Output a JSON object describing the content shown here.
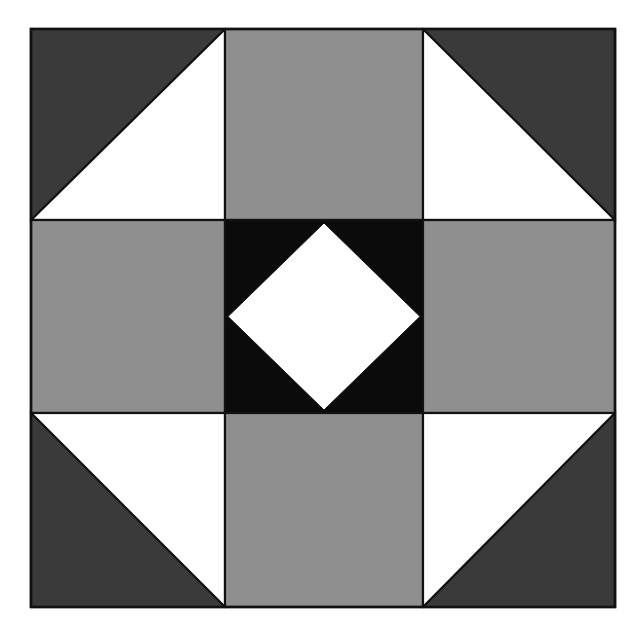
{
  "diagram": {
    "type": "quilt-block",
    "grid": {
      "rows": 3,
      "cols": 3,
      "col_edges": [
        31,
        225,
        423,
        615
      ],
      "row_edges": [
        29,
        220,
        413,
        607
      ]
    },
    "colors": {
      "background": "#ffffff",
      "dark": "#3a3a3a",
      "medium": "#8f8f8f",
      "center": "#0b0b0b",
      "light": "#ffffff",
      "stroke": "#111111"
    },
    "cells": [
      {
        "id": "top-left",
        "kind": "half-square-triangle",
        "dark_corner": "top-left"
      },
      {
        "id": "top-center",
        "kind": "solid",
        "fill": "medium"
      },
      {
        "id": "top-right",
        "kind": "half-square-triangle",
        "dark_corner": "top-right"
      },
      {
        "id": "middle-left",
        "kind": "solid",
        "fill": "medium"
      },
      {
        "id": "center",
        "kind": "square-in-square",
        "outer": "center",
        "inner": "light"
      },
      {
        "id": "middle-right",
        "kind": "solid",
        "fill": "medium"
      },
      {
        "id": "bottom-left",
        "kind": "half-square-triangle",
        "dark_corner": "bottom-left"
      },
      {
        "id": "bottom-center",
        "kind": "solid",
        "fill": "medium"
      },
      {
        "id": "bottom-right",
        "kind": "half-square-triangle",
        "dark_corner": "bottom-right"
      }
    ]
  }
}
